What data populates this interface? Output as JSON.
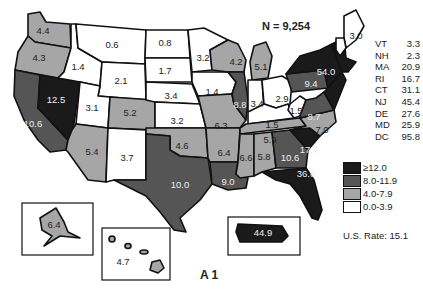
{
  "header": {
    "n_label": "N = 9,254"
  },
  "colors": {
    "class_0": "#ffffff",
    "class_1": "#a6a6a6",
    "class_2": "#555555",
    "class_3": "#1a1a1a",
    "border": "#111111"
  },
  "legend": {
    "items": [
      {
        "label": "≥12.0",
        "class": "c3"
      },
      {
        "label": "8.0-11.9",
        "class": "c2"
      },
      {
        "label": "4.0-7.9",
        "class": "c1"
      },
      {
        "label": "0.0-3.9",
        "class": "c0"
      }
    ]
  },
  "us_rate": "U.S. Rate: 15.1",
  "figure_label": "A 1",
  "small_states": [
    {
      "abbr": "VT",
      "value": "3.3"
    },
    {
      "abbr": "NH",
      "value": "2.3"
    },
    {
      "abbr": "MA",
      "value": "20.9"
    },
    {
      "abbr": "RI",
      "value": "16.7"
    },
    {
      "abbr": "CT",
      "value": "31.1"
    },
    {
      "abbr": "NJ",
      "value": "45.4"
    },
    {
      "abbr": "DE",
      "value": "27.6"
    },
    {
      "abbr": "MD",
      "value": "25.9"
    },
    {
      "abbr": "DC",
      "value": "95.8"
    }
  ],
  "states": {
    "WA": "4.4",
    "OR": "4.3",
    "CA": "10.6",
    "NV": "12.5",
    "ID": "1.4",
    "MT": "0.6",
    "WY": "2.1",
    "UT": "3.1",
    "AZ": "5.4",
    "CO": "5.2",
    "NM": "3.7",
    "ND": "0.8",
    "SD": "1.7",
    "NE": "3.4",
    "KS": "3.2",
    "OK": "4.6",
    "TX": "10.0",
    "MN": "3.2",
    "IA": "1.4",
    "MO": "6.3",
    "AR": "6.4",
    "LA": "9.0",
    "WI": "4.2",
    "IL": "8.8",
    "MI": "5.1",
    "IN": "3.4",
    "OH": "2.9",
    "KY": "1.5",
    "TN": "5.9",
    "MS": "6.6",
    "AL": "5.8",
    "GA": "10.6",
    "FL": "36.8",
    "SC": "17.7",
    "NC": "7.0",
    "VA": "8.7",
    "WV": "1.5",
    "PA": "9.4",
    "NY": "54.0",
    "ME": "3.0",
    "AK": "6.4",
    "HI": "4.7",
    "PR": "44.9"
  }
}
